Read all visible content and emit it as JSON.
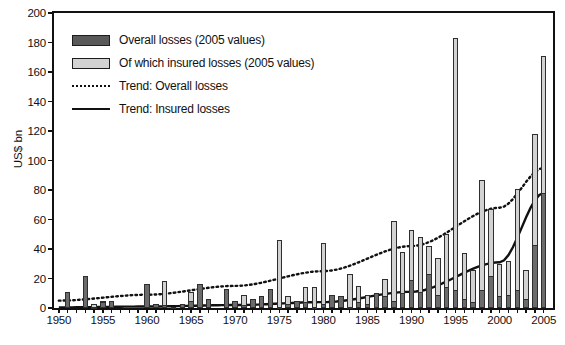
{
  "chart_data": {
    "type": "bar",
    "title": "",
    "subtitle": "",
    "xlabel": "",
    "ylabel": "US$ bn",
    "ylim": [
      0,
      200
    ],
    "ytick_step": 20,
    "yticks": [
      0,
      20,
      40,
      60,
      80,
      100,
      120,
      140,
      160,
      180,
      200
    ],
    "xlim": [
      1950,
      2005
    ],
    "xticks_labeled": [
      1950,
      1955,
      1960,
      1965,
      1970,
      1975,
      1980,
      1985,
      1990,
      1995,
      2000,
      2005
    ],
    "xtick_minor_interval": 1,
    "grid": false,
    "legend_position": "upper-left-inside",
    "stacking": "overlaid",
    "colors": {
      "overall": "#6b6b6b",
      "insured": "#d2d2d2",
      "outline": "#2e2e2e",
      "trend_overall": "#111111",
      "trend_insured": "#111111",
      "axis": "#111111",
      "background": "#ffffff"
    },
    "legend": [
      {
        "key": "overall",
        "label": "Overall losses (2005 values)",
        "marker": "dark-gray-bar"
      },
      {
        "key": "insured",
        "label": "Of which insured losses (2005 values)",
        "marker": "light-gray-bar"
      },
      {
        "key": "trend_overall",
        "label": "Trend: Overall losses",
        "marker": "dotted-line"
      },
      {
        "key": "trend_insured",
        "label": "Trend: Insured losses",
        "marker": "solid-line"
      }
    ],
    "categories": [
      1950,
      1951,
      1952,
      1953,
      1954,
      1955,
      1956,
      1957,
      1958,
      1959,
      1960,
      1961,
      1962,
      1963,
      1964,
      1965,
      1966,
      1967,
      1968,
      1969,
      1970,
      1971,
      1972,
      1973,
      1974,
      1975,
      1976,
      1977,
      1978,
      1979,
      1980,
      1981,
      1982,
      1983,
      1984,
      1985,
      1986,
      1987,
      1988,
      1989,
      1990,
      1991,
      1992,
      1993,
      1994,
      1995,
      1996,
      1997,
      1998,
      1999,
      2000,
      2001,
      2002,
      2003,
      2004,
      2005
    ],
    "series": [
      {
        "name": "Overall losses (2005 values)",
        "values": [
          0,
          11,
          0,
          22,
          3,
          5,
          5,
          0,
          0,
          0,
          16,
          3,
          18,
          1,
          3,
          11,
          16,
          6,
          0,
          13,
          5,
          9,
          6,
          8,
          13,
          46,
          8,
          5,
          14,
          14,
          44,
          9,
          8,
          23,
          15,
          9,
          10,
          20,
          59,
          38,
          53,
          48,
          42,
          34,
          50,
          183,
          37,
          26,
          87,
          67,
          30,
          32,
          81,
          26,
          118,
          171
        ]
      },
      {
        "name": "Of which insured losses (2005 values)",
        "values": [
          0,
          0,
          0,
          0,
          1,
          4,
          0,
          0,
          0,
          0,
          0,
          0,
          2,
          0,
          0,
          5,
          0,
          0,
          0,
          0,
          0,
          2,
          0,
          0,
          0,
          1,
          3,
          0,
          4,
          1,
          3,
          0,
          0,
          1,
          4,
          3,
          0,
          8,
          5,
          10,
          19,
          11,
          23,
          9,
          14,
          12,
          6,
          4,
          12,
          22,
          8,
          9,
          12,
          6,
          43,
          78
        ]
      }
    ],
    "trend_overall": {
      "name": "Trend: Overall losses",
      "style": "dotted",
      "points": [
        {
          "x": 1950,
          "y": 5
        },
        {
          "x": 1960,
          "y": 9
        },
        {
          "x": 1970,
          "y": 15
        },
        {
          "x": 1980,
          "y": 25
        },
        {
          "x": 1990,
          "y": 42
        },
        {
          "x": 2000,
          "y": 68
        },
        {
          "x": 2005,
          "y": 95
        }
      ]
    },
    "trend_insured": {
      "name": "Trend: Insured losses",
      "style": "solid",
      "points": [
        {
          "x": 1950,
          "y": 0.4
        },
        {
          "x": 1960,
          "y": 1
        },
        {
          "x": 1970,
          "y": 2
        },
        {
          "x": 1980,
          "y": 4
        },
        {
          "x": 1990,
          "y": 11
        },
        {
          "x": 2000,
          "y": 31
        },
        {
          "x": 2005,
          "y": 78
        }
      ]
    }
  }
}
